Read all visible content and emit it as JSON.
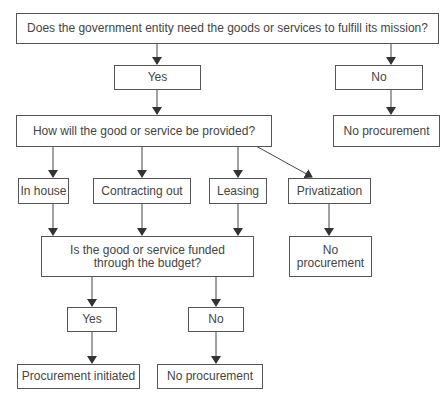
{
  "diagram": {
    "type": "flowchart",
    "nodes": {
      "need_question": "Does the government entity need the goods or services to fulfill its mission?",
      "need_yes": "Yes",
      "need_no": "No",
      "need_no_result": "No procurement",
      "how_question": "How will the good or service be provided?",
      "in_house": "In house",
      "contracting_out": "Contracting out",
      "leasing": "Leasing",
      "privatization": "Privatization",
      "privatization_result": "No procurement",
      "budget_question": "Is the good or service funded through the budget?",
      "budget_yes": "Yes",
      "budget_no": "No",
      "budget_yes_result": "Procurement initiated",
      "budget_no_result": "No procurement"
    },
    "edges": [
      [
        "need_question",
        "need_yes"
      ],
      [
        "need_question",
        "need_no"
      ],
      [
        "need_no",
        "need_no_result"
      ],
      [
        "need_yes",
        "how_question"
      ],
      [
        "how_question",
        "in_house"
      ],
      [
        "how_question",
        "contracting_out"
      ],
      [
        "how_question",
        "leasing"
      ],
      [
        "how_question",
        "privatization"
      ],
      [
        "privatization",
        "privatization_result"
      ],
      [
        "in_house",
        "budget_question"
      ],
      [
        "contracting_out",
        "budget_question"
      ],
      [
        "leasing",
        "budget_question"
      ],
      [
        "budget_question",
        "budget_yes"
      ],
      [
        "budget_question",
        "budget_no"
      ],
      [
        "budget_yes",
        "budget_yes_result"
      ],
      [
        "budget_no",
        "budget_no_result"
      ]
    ],
    "colors": {
      "line": "#444444",
      "border": "#555555",
      "text": "#444444",
      "background": "#ffffff"
    }
  }
}
